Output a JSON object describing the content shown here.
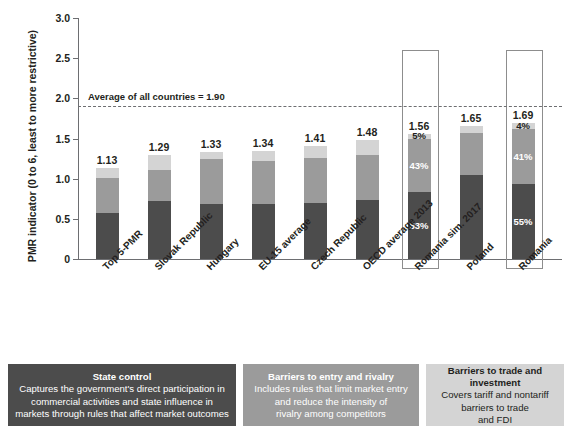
{
  "chart_data": {
    "type": "bar",
    "subtype": "stacked-bar",
    "title": "",
    "xlabel": "",
    "ylabel": "PMR indicator (0 to 6, least to more restrictive)",
    "ylim": [
      0,
      3.0
    ],
    "yticks": [
      "0",
      "0.5",
      "1.0",
      "1.5",
      "2.0",
      "2.5",
      "3.0"
    ],
    "ytick_values": [
      0,
      0.5,
      1.0,
      1.5,
      2.0,
      2.5,
      3.0
    ],
    "grid": false,
    "legend_position": "bottom",
    "categories": [
      "Top 5-PMR",
      "Slovak Republic",
      "Hungary",
      "EU-15 average",
      "Czech Republic",
      "OECD average 2013",
      "Romania sim. 2017",
      "Poland",
      "Romania"
    ],
    "totals": [
      1.13,
      1.29,
      1.33,
      1.34,
      1.41,
      1.48,
      1.56,
      1.65,
      1.69
    ],
    "total_labels": [
      "1.13",
      "1.29",
      "1.33",
      "1.34",
      "1.41",
      "1.48",
      "1.56",
      "1.65",
      "1.69"
    ],
    "series": [
      {
        "name": "State control",
        "color": "#4c4c4c",
        "values": [
          0.57,
          0.72,
          0.68,
          0.68,
          0.7,
          0.73,
          0.83,
          1.04,
          0.93
        ]
      },
      {
        "name": "Barriers to entry and rivalry",
        "color": "#9b9b9b",
        "values": [
          0.44,
          0.39,
          0.57,
          0.54,
          0.56,
          0.57,
          0.67,
          0.53,
          0.69
        ]
      },
      {
        "name": "Barriers to trade and investment",
        "color": "#d4d4d4",
        "values": [
          0.12,
          0.18,
          0.08,
          0.12,
          0.15,
          0.18,
          0.06,
          0.08,
          0.07
        ]
      }
    ],
    "segment_percent_labels": {
      "Romania sim. 2017": {
        "Barriers to trade and investment": "5%",
        "Barriers to entry and rivalry": "43%",
        "State control": "53%"
      },
      "Romania": {
        "Barriers to trade and investment": "4%",
        "Barriers to entry and rivalry": "41%",
        "State control": "55%"
      }
    },
    "highlighted_categories": [
      "Romania sim. 2017",
      "Romania"
    ],
    "annotations": [
      {
        "name": "average-line",
        "text": "Average of all countries = 1.90",
        "value": 1.9,
        "style": "dashed-horizontal-line"
      }
    ]
  },
  "legend": {
    "boxes": [
      {
        "id": "state-control",
        "title": "State control",
        "description_lines": [
          "Captures the government's direct participation in",
          "commercial activities and state influence in",
          "markets through rules that affect market outcomes"
        ],
        "color": "#4c4c4c",
        "text_color": "#ffffff"
      },
      {
        "id": "barriers-to-entry",
        "title": "Barriers to entry and rivalry",
        "description_lines": [
          "Includes rules that limit market entry",
          "and reduce the intensity of",
          "rivalry among competitors"
        ],
        "color": "#9b9b9b",
        "text_color": "#ffffff"
      },
      {
        "id": "barriers-to-trade",
        "title": "Barriers to trade and investment",
        "description_lines": [
          "Covers tariff and nontariff",
          "barriers to trade",
          "and FDI"
        ],
        "color": "#d4d4d4",
        "text_color": "#231f20"
      }
    ]
  }
}
